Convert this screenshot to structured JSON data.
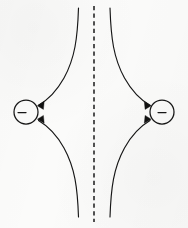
{
  "figure": {
    "background_color": "#fbfbfa",
    "ink_color": "#161616",
    "width": 188,
    "height": 228
  },
  "chart_data": {
    "type": "diagram",
    "xlabel": "",
    "ylabel": "",
    "xlim": [
      0,
      188
    ],
    "ylim": [
      0,
      228
    ],
    "grid": false,
    "legend": null,
    "symmetry_axis": {
      "name": "perpendicular-bisector",
      "orientation": "vertical",
      "style": "dashed",
      "x": 94,
      "y_start": 6,
      "y_end": 222
    },
    "charges": [
      {
        "id": "left-charge",
        "sign": "−",
        "polarity": "negative",
        "center_x": 26,
        "center_y": 112,
        "radius": 12
      },
      {
        "id": "right-charge",
        "sign": "−",
        "polarity": "negative",
        "center_x": 162,
        "center_y": 112,
        "radius": 12
      }
    ],
    "field_lines": [
      {
        "id": "upper-left-line",
        "from": "top-edge",
        "to": "left-charge",
        "direction": "inward",
        "arrowheads": 1
      },
      {
        "id": "lower-left-line",
        "from": "bottom-edge",
        "to": "left-charge",
        "direction": "inward",
        "arrowheads": 1
      },
      {
        "id": "upper-right-line",
        "from": "top-edge",
        "to": "right-charge",
        "direction": "inward",
        "arrowheads": 1
      },
      {
        "id": "lower-right-line",
        "from": "bottom-edge",
        "to": "right-charge",
        "direction": "inward",
        "arrowheads": 1
      }
    ],
    "arrow_markers": [
      {
        "id": "left-upper-arrow",
        "x": 36,
        "y": 106,
        "points": "left"
      },
      {
        "id": "left-lower-arrow",
        "x": 36,
        "y": 118,
        "points": "left"
      },
      {
        "id": "right-upper-arrow",
        "x": 152,
        "y": 106,
        "points": "right"
      },
      {
        "id": "right-lower-arrow",
        "x": 152,
        "y": 118,
        "points": "right"
      }
    ],
    "annotations": []
  }
}
